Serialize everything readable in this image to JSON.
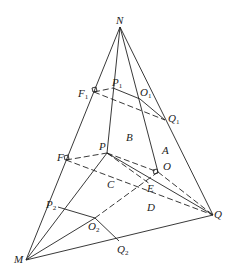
{
  "diagram": {
    "type": "geometry",
    "points": {
      "N": [
        120,
        27
      ],
      "M": [
        26,
        260
      ],
      "Q": [
        213,
        215
      ],
      "P": [
        107,
        153
      ],
      "O": [
        158,
        172
      ],
      "F": [
        66,
        160
      ],
      "E": [
        150,
        184
      ],
      "F1": [
        94,
        92
      ],
      "P1": [
        113,
        88
      ],
      "O1": [
        140,
        99
      ],
      "Q1": [
        165,
        120
      ],
      "P2": [
        58,
        207
      ],
      "O2": [
        95,
        218
      ],
      "Q2": [
        119,
        241
      ]
    },
    "labels": [
      {
        "id": "N",
        "text": "N",
        "sub": "",
        "x": 116,
        "y": 24
      },
      {
        "id": "F1",
        "text": "F",
        "sub": "1",
        "x": 78,
        "y": 97
      },
      {
        "id": "P1",
        "text": "P",
        "sub": "1",
        "x": 112,
        "y": 86
      },
      {
        "id": "O1",
        "text": "O",
        "sub": "1",
        "x": 140,
        "y": 96
      },
      {
        "id": "Q1",
        "text": "Q",
        "sub": "1",
        "x": 168,
        "y": 122
      },
      {
        "id": "B",
        "text": "B",
        "sub": "",
        "x": 126,
        "y": 141
      },
      {
        "id": "A",
        "text": "A",
        "sub": "",
        "x": 162,
        "y": 154
      },
      {
        "id": "F",
        "text": "F",
        "sub": "",
        "x": 57,
        "y": 161
      },
      {
        "id": "P",
        "text": "P",
        "sub": "",
        "x": 99,
        "y": 150
      },
      {
        "id": "O",
        "text": "O",
        "sub": "",
        "x": 163,
        "y": 170
      },
      {
        "id": "C",
        "text": "C",
        "sub": "",
        "x": 107,
        "y": 188
      },
      {
        "id": "E",
        "text": "E",
        "sub": "",
        "x": 147,
        "y": 192
      },
      {
        "id": "D",
        "text": "D",
        "sub": "",
        "x": 147,
        "y": 211
      },
      {
        "id": "P2",
        "text": "P",
        "sub": "2",
        "x": 46,
        "y": 208
      },
      {
        "id": "O2",
        "text": "O",
        "sub": "2",
        "x": 88,
        "y": 230
      },
      {
        "id": "Q2",
        "text": "Q",
        "sub": "2",
        "x": 117,
        "y": 253
      },
      {
        "id": "Q",
        "text": "Q",
        "sub": "",
        "x": 214,
        "y": 218
      },
      {
        "id": "M",
        "text": "M",
        "sub": "",
        "x": 14,
        "y": 263
      }
    ],
    "solid_edges": [
      [
        "N",
        "M"
      ],
      [
        "N",
        "Q"
      ],
      [
        "M",
        "Q"
      ],
      [
        "N",
        "P"
      ],
      [
        "P",
        "M"
      ],
      [
        "N",
        "O"
      ],
      [
        "P1",
        "O1"
      ],
      [
        "O1",
        "Q1"
      ],
      [
        "P2",
        "O2"
      ],
      [
        "O2",
        "Q2"
      ],
      [
        "M",
        "O2"
      ],
      [
        "P",
        "Q"
      ]
    ],
    "dashed_edges": [
      [
        "F1",
        "P1"
      ],
      [
        "F1",
        "Q1"
      ],
      [
        "F",
        "P"
      ],
      [
        "F",
        "Q"
      ],
      [
        "P",
        "O"
      ],
      [
        "O",
        "Q"
      ],
      [
        "O2",
        "O"
      ],
      [
        "P",
        "E"
      ]
    ]
  }
}
